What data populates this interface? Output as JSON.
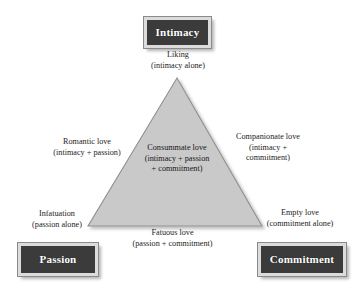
{
  "diagram": {
    "background_color": "#ffffff",
    "triangle": {
      "fill_color": "#c9c9c9",
      "stroke_color": "#8f8f8f",
      "apex": [
        177,
        78
      ],
      "bottom_left": [
        88,
        226
      ],
      "bottom_right": [
        262,
        226
      ]
    },
    "vertices": [
      {
        "id": "intimacy",
        "label": "Intimacy",
        "fill_color": "#3b3b3b",
        "border_color": "#dcdcdc",
        "text_color": "#ffffff"
      },
      {
        "id": "passion",
        "label": "Passion",
        "fill_color": "#3b3b3b",
        "border_color": "#dcdcdc",
        "text_color": "#ffffff"
      },
      {
        "id": "commitment",
        "label": "Commitment",
        "fill_color": "#3b3b3b",
        "border_color": "#dcdcdc",
        "text_color": "#ffffff"
      }
    ],
    "labels": {
      "liking": {
        "line1": "Liking",
        "line2": "(intimacy alone)"
      },
      "romantic": {
        "line1": "Romantic love",
        "line2": "(intimacy + passion)"
      },
      "companionate": {
        "line1": "Companionate love",
        "line2": "(intimacy +",
        "line3": "commitment)"
      },
      "consummate": {
        "line1": "Consummate love",
        "line2": "(intimacy + passion",
        "line3": "+ commitment)"
      },
      "infatuation": {
        "line1": "Infatuation",
        "line2": "(passion alone)"
      },
      "fatuous": {
        "line1": "Fatuous love",
        "line2": "(passion + commitment)"
      },
      "empty": {
        "line1": "Empty love",
        "line2": "(commitment alone)"
      }
    }
  }
}
